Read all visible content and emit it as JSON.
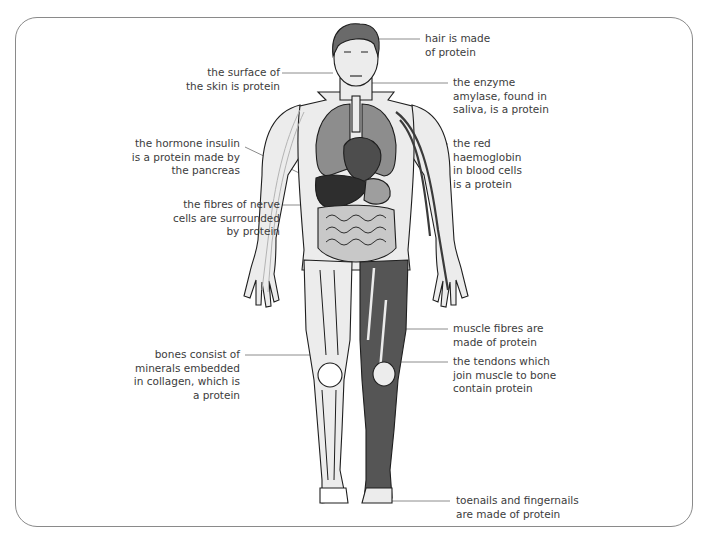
{
  "diagram": {
    "title": "",
    "colors": {
      "frame": "#8a8a8a",
      "leader_line": "#8c8c8c",
      "skin": "#ececec",
      "outline": "#1e1e1e",
      "hair": "#6a6a6a",
      "lungs": "#8d8d8d",
      "heart": "#4d4d4d",
      "liver": "#2e2e2e",
      "stomach": "#9e9e9e",
      "intestines": "#c8c8c8",
      "muscle": "#555555",
      "blood_vessel": "#3b3b3b",
      "nerve": "#b4b4b4",
      "text": "#3c3c3c"
    },
    "labels": [
      {
        "id": "hair",
        "side": "right",
        "text": "hair is made\nof protein"
      },
      {
        "id": "skin",
        "side": "left",
        "text": "the surface of\nthe skin is protein"
      },
      {
        "id": "amylase",
        "side": "right",
        "text": "the enzyme\namylase, found in\nsaliva, is a protein"
      },
      {
        "id": "insulin",
        "side": "left",
        "text": "the hormone insulin\nis a protein made by\nthe pancreas"
      },
      {
        "id": "haemoglobin",
        "side": "right",
        "text": "the red\nhaemoglobin\nin blood cells\nis a protein"
      },
      {
        "id": "nerve",
        "side": "left",
        "text": "the fibres of nerve\ncells are surrounded\nby protein"
      },
      {
        "id": "muscle",
        "side": "right",
        "text": "muscle fibres are\nmade of protein"
      },
      {
        "id": "bones",
        "side": "left",
        "text": "bones consist of\nminerals embedded\nin collagen, which is\na protein"
      },
      {
        "id": "tendons",
        "side": "right",
        "text": "the tendons which\njoin muscle to bone\ncontain protein"
      },
      {
        "id": "nails",
        "side": "right",
        "text": "toenails and fingernails\nare made of protein"
      }
    ]
  }
}
